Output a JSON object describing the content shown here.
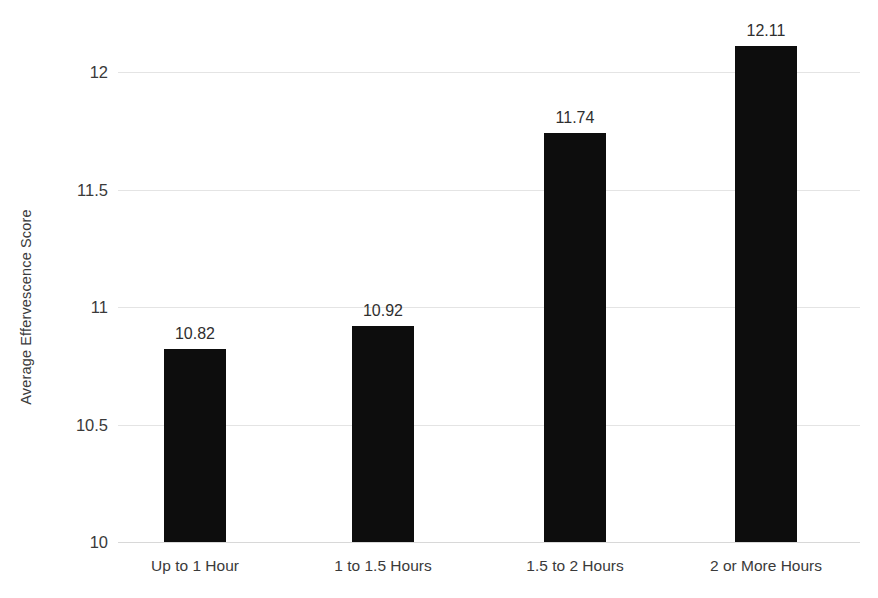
{
  "chart_data": {
    "type": "bar",
    "title": "",
    "subtitle": "",
    "xlabel": "",
    "ylabel": "Average Effervescence Score",
    "categories": [
      "Up to 1 Hour",
      "1 to 1.5 Hours",
      "1.5 to 2 Hours",
      "2 or More Hours"
    ],
    "values": [
      10.82,
      10.92,
      11.74,
      12.11
    ],
    "data_labels": [
      "10.82",
      "10.92",
      "11.74",
      "12.11"
    ],
    "ylim": [
      10,
      12
    ],
    "y_ticks": [
      10,
      10.5,
      11,
      11.5,
      12
    ],
    "y_tick_labels": [
      "10",
      "10.5",
      "11",
      "11.5",
      "12"
    ],
    "grid": true,
    "grid_axis": "y",
    "legend": false,
    "legend_position": "none",
    "bar_color": "#0d0d0d",
    "gridline_color": "#e4e4e4",
    "background_color": "#ffffff",
    "axis_text_color": "#3a3a3a"
  }
}
